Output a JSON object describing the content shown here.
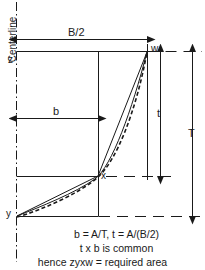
{
  "figure": {
    "centerline_label": "Centerline",
    "points": {
      "z": "z",
      "w": "w",
      "x": "x",
      "y": "y"
    },
    "dimensions": {
      "b_half": "B/2",
      "b": "b",
      "t": "t",
      "T": "T"
    },
    "caption": {
      "line1": "b = A/T,  t = A/(B/2)",
      "line2": "t x b is common",
      "line3": "hence  zyxw = required area"
    },
    "colors": {
      "line": "#1a1a1a",
      "background": "#ffffff"
    }
  }
}
